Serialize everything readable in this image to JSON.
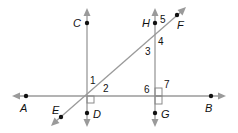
{
  "diagram": {
    "colors": {
      "line": "#9a9a9a",
      "point": "#111111",
      "text": "#111111"
    },
    "points": {
      "A": "A",
      "B": "B",
      "C": "C",
      "D": "D",
      "E": "E",
      "F": "F",
      "G": "G",
      "H": "H"
    },
    "angles": {
      "a1": "1",
      "a2": "2",
      "a3": "3",
      "a4": "4",
      "a5": "5",
      "a6": "6",
      "a7": "7"
    },
    "right_angle_marks": [
      "CD ⊥ AB at intersection near D",
      "HG ⊥ AB at intersection near G"
    ]
  }
}
